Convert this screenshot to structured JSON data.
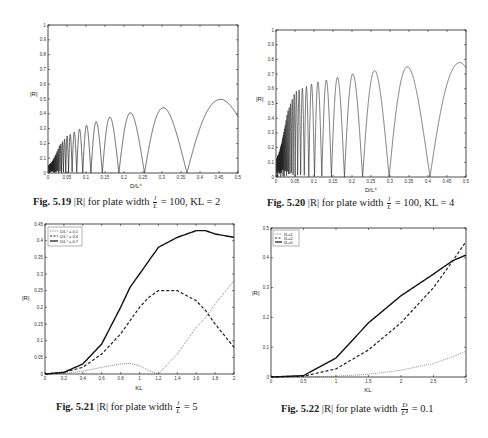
{
  "figures": [
    {
      "id": "5.19",
      "caption": {
        "label": "Fig. 5.19",
        "text_before": " |R| for plate width ",
        "frac_num": "l",
        "frac_den": "L",
        "text_after": " = 100, KL = 2"
      },
      "ylabel": "|R|",
      "xlabel": "D/L⁴",
      "yticks": [
        "0",
        "0.1",
        "0.2",
        "0.3",
        "0.4",
        "0.5",
        "0.6",
        "0.7",
        "0.8",
        "0.9",
        "1"
      ],
      "xticks": [
        "0",
        "0.05",
        "0.1",
        "0.15",
        "0.2",
        "0.25",
        "0.3",
        "0.35",
        "0.4",
        "0.45",
        "0.5"
      ]
    },
    {
      "id": "5.20",
      "caption": {
        "label": "Fig. 5.20",
        "text_before": " |R| for plate width ",
        "frac_num": "l",
        "frac_den": "L",
        "text_after": " = 100, KL = 4"
      },
      "ylabel": "|R|",
      "xlabel": "D/L⁴",
      "yticks": [
        "0",
        "0.1",
        "0.2",
        "0.3",
        "0.4",
        "0.5",
        "0.6",
        "0.7",
        "0.8",
        "0.9",
        "1"
      ],
      "xticks": [
        "0",
        "0.05",
        "0.1",
        "0.15",
        "0.2",
        "0.25",
        "0.3",
        "0.35",
        "0.4",
        "0.45",
        "0.5"
      ]
    },
    {
      "id": "5.21",
      "caption": {
        "label": "Fig. 5.21",
        "text_before": " |R| for plate width ",
        "frac_num": "l",
        "frac_den": "L",
        "text_after": " = 5"
      },
      "ylabel": "|R|",
      "xlabel": "KL",
      "yticks": [
        "0",
        "0.05",
        "0.1",
        "0.15",
        "0.2",
        "0.25",
        "0.3",
        "0.35",
        "0.4",
        "0.45"
      ],
      "xticks": [
        "0",
        "0.2",
        "0.4",
        "0.6",
        "0.8",
        "1",
        "1.2",
        "1.4",
        "1.6",
        "1.8",
        "2"
      ],
      "legend": [
        "D/L⁴ = 0.1",
        "D/L⁴ = 0.4",
        "D/L⁴ = 0.7"
      ]
    },
    {
      "id": "5.22",
      "caption": {
        "label": "Fig. 5.22",
        "text_before": " |R| for plate width ",
        "frac_num": "D",
        "frac_den": "L⁴",
        "text_after": " = 0.1"
      },
      "ylabel": "|R|",
      "xlabel": "KL",
      "yticks": [
        "0",
        "0.1",
        "0.2",
        "0.3",
        "0.4",
        "0.5"
      ],
      "xticks": [
        "0",
        "0.5",
        "1",
        "1.5",
        "2",
        "2.5",
        "3"
      ],
      "legend": [
        "l/L=1",
        "l/L=2",
        "l/L=5"
      ]
    }
  ],
  "chart_data": [
    {
      "type": "line",
      "title": "Fig. 5.19 |R| for plate width l/L = 100, KL = 2",
      "xlabel": "D/L^4",
      "ylabel": "|R|",
      "xlim": [
        0,
        0.5
      ],
      "ylim": [
        0,
        1
      ],
      "grid": false,
      "series": [
        {
          "name": "|R|",
          "description": "oscillating lobes with zeros; peak envelope rising",
          "envelope_x": [
            0.01,
            0.05,
            0.1,
            0.15,
            0.2,
            0.25,
            0.3,
            0.35,
            0.4,
            0.46
          ],
          "envelope_y": [
            0.12,
            0.25,
            0.32,
            0.37,
            0.4,
            0.42,
            0.44,
            0.46,
            0.48,
            0.5
          ],
          "zeros_x": [
            0.25,
            0.3,
            0.34,
            0.39,
            0.43,
            0.48
          ]
        }
      ]
    },
    {
      "type": "line",
      "title": "Fig. 5.20 |R| for plate width l/L = 100, KL = 4",
      "xlabel": "D/L^4",
      "ylabel": "|R|",
      "xlim": [
        0,
        0.5
      ],
      "ylim": [
        0,
        1
      ],
      "grid": false,
      "series": [
        {
          "name": "|R|",
          "description": "dense oscillations, peak envelope rising",
          "envelope_x": [
            0.01,
            0.05,
            0.1,
            0.15,
            0.2,
            0.25,
            0.3,
            0.35,
            0.4,
            0.45,
            0.49
          ],
          "envelope_y": [
            0.3,
            0.58,
            0.64,
            0.67,
            0.7,
            0.72,
            0.74,
            0.75,
            0.76,
            0.77,
            0.78
          ]
        }
      ]
    },
    {
      "type": "line",
      "title": "Fig. 5.21 |R| for plate width l/L = 5",
      "xlabel": "KL",
      "ylabel": "|R|",
      "xlim": [
        0,
        2
      ],
      "ylim": [
        0,
        0.45
      ],
      "grid": false,
      "legend_position": "upper left",
      "x": [
        0,
        0.2,
        0.4,
        0.6,
        0.8,
        0.9,
        1.0,
        1.1,
        1.2,
        1.4,
        1.6,
        1.7,
        1.8,
        2.0
      ],
      "series": [
        {
          "name": "D/L⁴ = 0.1",
          "style": "dotted",
          "values": [
            0,
            0.002,
            0.008,
            0.02,
            0.03,
            0.032,
            0.025,
            0.01,
            0,
            0.06,
            0.14,
            0.17,
            0.21,
            0.28
          ]
        },
        {
          "name": "D/L⁴ = 0.4",
          "style": "dashed",
          "values": [
            0,
            0.005,
            0.02,
            0.06,
            0.12,
            0.16,
            0.2,
            0.23,
            0.25,
            0.25,
            0.22,
            0.19,
            0.15,
            0.08
          ]
        },
        {
          "name": "D/L⁴ = 0.7",
          "style": "solid",
          "values": [
            0,
            0.005,
            0.03,
            0.09,
            0.2,
            0.26,
            0.3,
            0.34,
            0.38,
            0.41,
            0.43,
            0.43,
            0.42,
            0.41
          ]
        }
      ]
    },
    {
      "type": "line",
      "title": "Fig. 5.22 |R| for plate width D/L⁴ = 0.1",
      "xlabel": "KL",
      "ylabel": "|R|",
      "xlim": [
        0,
        3
      ],
      "ylim": [
        0,
        0.55
      ],
      "grid": false,
      "legend_position": "upper left",
      "x": [
        0,
        0.5,
        1,
        1.5,
        2,
        2.5,
        2.8,
        3
      ],
      "series": [
        {
          "name": "l/L=1",
          "style": "dotted",
          "values": [
            0,
            0,
            0.003,
            0.01,
            0.025,
            0.05,
            0.075,
            0.095
          ]
        },
        {
          "name": "l/L=2",
          "style": "dashed",
          "values": [
            0,
            0.003,
            0.03,
            0.1,
            0.2,
            0.33,
            0.43,
            0.5
          ]
        },
        {
          "name": "l/L=5",
          "style": "solid",
          "values": [
            0,
            0.005,
            0.07,
            0.2,
            0.3,
            0.38,
            0.43,
            0.45
          ]
        }
      ]
    }
  ]
}
